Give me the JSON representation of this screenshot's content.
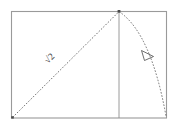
{
  "figure": {
    "labels": {
      "diagonal_label": "√2",
      "diagonal_label_text": "2",
      "radical_symbol": "√"
    },
    "colors": {
      "frame": "#9a9a9a",
      "dashed_path": "#5a5a5a",
      "vertical_line": "#8e8e8e",
      "arrowhead": "#4a4a4a",
      "label": "#3d3d3d",
      "background": "#ffffff"
    },
    "geometry": {
      "frame": {
        "left": 11,
        "top": 11,
        "right": 167,
        "bottom": 118
      },
      "apex": {
        "x": 119,
        "y": 11
      },
      "diagonal_start": {
        "x": 12,
        "y": 118
      },
      "diagonal_end": {
        "x": 119,
        "y": 11
      },
      "vertical_line": {
        "x": 119,
        "top": 11,
        "bottom": 118
      },
      "arc_start": {
        "x": 119,
        "y": 11
      },
      "arc_control": {
        "x": 150,
        "y": 34
      },
      "arc_end": {
        "x": 166,
        "y": 116
      },
      "arrowhead_center": {
        "x": 148,
        "y": 55
      }
    },
    "elements": [
      "outer-frame",
      "dashed-diagonal",
      "vertical-divider",
      "dashed-parabolic-arc",
      "arc-arrowhead",
      "sqrt2-label",
      "apex-marker",
      "origin-marker"
    ]
  }
}
